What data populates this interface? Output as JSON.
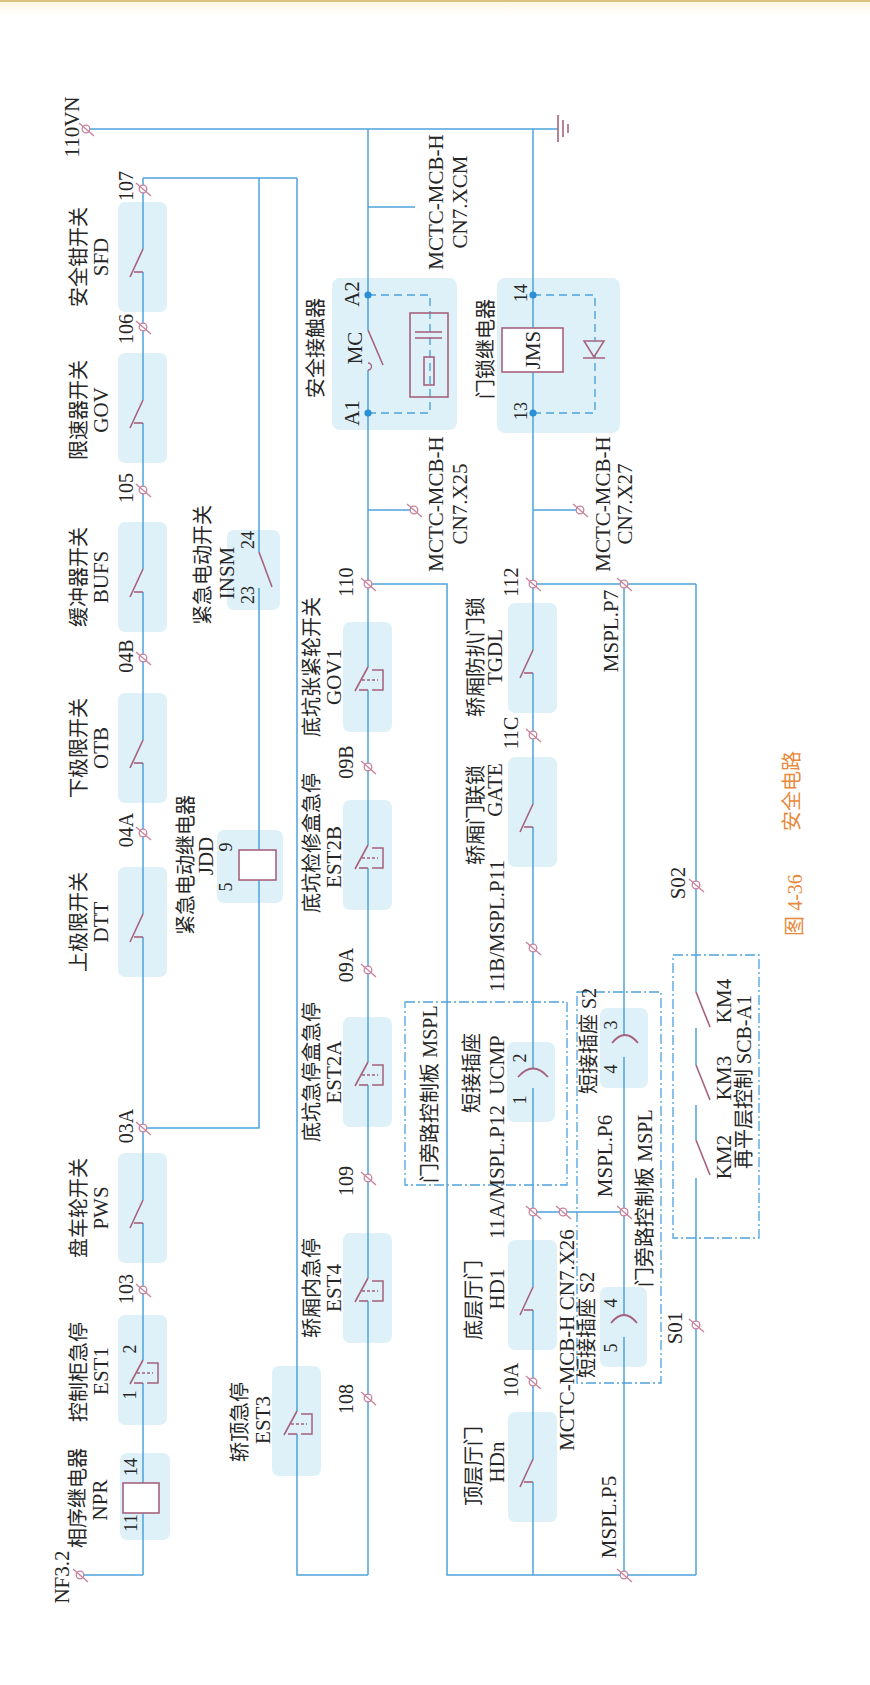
{
  "figure": {
    "number": "图 4-36",
    "title": "安全电路"
  },
  "supply": {
    "top": "110VN",
    "bottom": "NF3.2"
  },
  "chain_1": {
    "components": [
      {
        "name": "安全钳开关",
        "code": "SFD"
      },
      {
        "name": "限速器开关",
        "code": "GOV"
      },
      {
        "name": "缓冲器开关",
        "code": "BUFS"
      },
      {
        "name": "下极限开关",
        "code": "OTB"
      },
      {
        "name": "上极限开关",
        "code": "DTT"
      },
      {
        "name": "盘车轮开关",
        "code": "PWS"
      },
      {
        "name": "控制柜急停",
        "code": "EST1",
        "pins": [
          "1",
          "2"
        ]
      },
      {
        "name": "相序继电器",
        "code": "NPR",
        "pins": [
          "11",
          "14"
        ]
      }
    ],
    "terminals": [
      "107",
      "106",
      "105",
      "04B",
      "04A",
      "03A",
      "103"
    ]
  },
  "emergency_electric": {
    "switch": {
      "name": "紧急电动开关",
      "code": "INSM",
      "pins": [
        "23",
        "24"
      ]
    },
    "relay": {
      "name": "紧急电动继电器",
      "code": "JDD",
      "pins": [
        "5",
        "9"
      ]
    }
  },
  "car_top_stop": {
    "name": "轿顶急停",
    "code": "EST3"
  },
  "chain_2": {
    "contactor": {
      "name": "安全接触器",
      "code": "MC",
      "pins": [
        "A1",
        "A2"
      ]
    },
    "components": [
      {
        "name": "底坑张紧轮开关",
        "code": "GOV1"
      },
      {
        "name": "底坑检修盒急停",
        "code": "EST2B"
      },
      {
        "name": "底坑急停盒急停",
        "code": "EST2A"
      },
      {
        "name": "轿厢内急停",
        "code": "EST4"
      }
    ],
    "terminals": [
      "110",
      "09B",
      "09A",
      "109",
      "108"
    ]
  },
  "connectors": {
    "xcm": [
      "MCTC-MCB-H",
      "CN7.XCM"
    ],
    "x25": [
      "MCTC-MCB-H",
      "CN7.X25"
    ],
    "x27": [
      "MCTC-MCB-H",
      "CN7.X27"
    ],
    "x26": "MCTC-MCB-H CN7.X26"
  },
  "door_chain": {
    "relay": {
      "name": "门锁继电器",
      "code": "JMS",
      "pins": [
        "13",
        "14"
      ]
    },
    "components": [
      {
        "name": "轿厢防扒门锁",
        "code": "TGDL"
      },
      {
        "name": "轿厢门联锁",
        "code": "GATE"
      },
      {
        "name": "底层厅门",
        "code": "HD1"
      },
      {
        "name": "顶层厅门",
        "code": "HDn"
      }
    ],
    "terminals": [
      "112",
      "11C",
      "11B/MSPL.P11",
      "11A/MSPL.P12",
      "10A"
    ]
  },
  "bypass": {
    "board_label": "门旁路控制板 MSPL",
    "ucmp": {
      "name": "短接插座",
      "code": "UCMP",
      "pins": [
        "1",
        "2"
      ]
    },
    "s2_upper": {
      "label": "短接插座 S2",
      "pins": [
        "3",
        "4"
      ]
    },
    "s2_lower": {
      "label": "短接插座 S2",
      "pins": [
        "4",
        "5"
      ]
    },
    "terminals": {
      "p7": "MSPL.P7",
      "p6": "MSPL.P6",
      "p5": "MSPL.P5"
    }
  },
  "relevel": {
    "board_label": "再平层控制 SCB-A1",
    "contacts": [
      "KM4",
      "KM3",
      "KM2"
    ],
    "terminals": [
      "S02",
      "S01"
    ]
  },
  "colors": {
    "wire": "#4da3dc",
    "symbol": "#a5627e",
    "terminal": "#c7829c",
    "component_box": "#dff1f8",
    "caption": "#e8893c",
    "top_rule": "#d8c27c"
  }
}
